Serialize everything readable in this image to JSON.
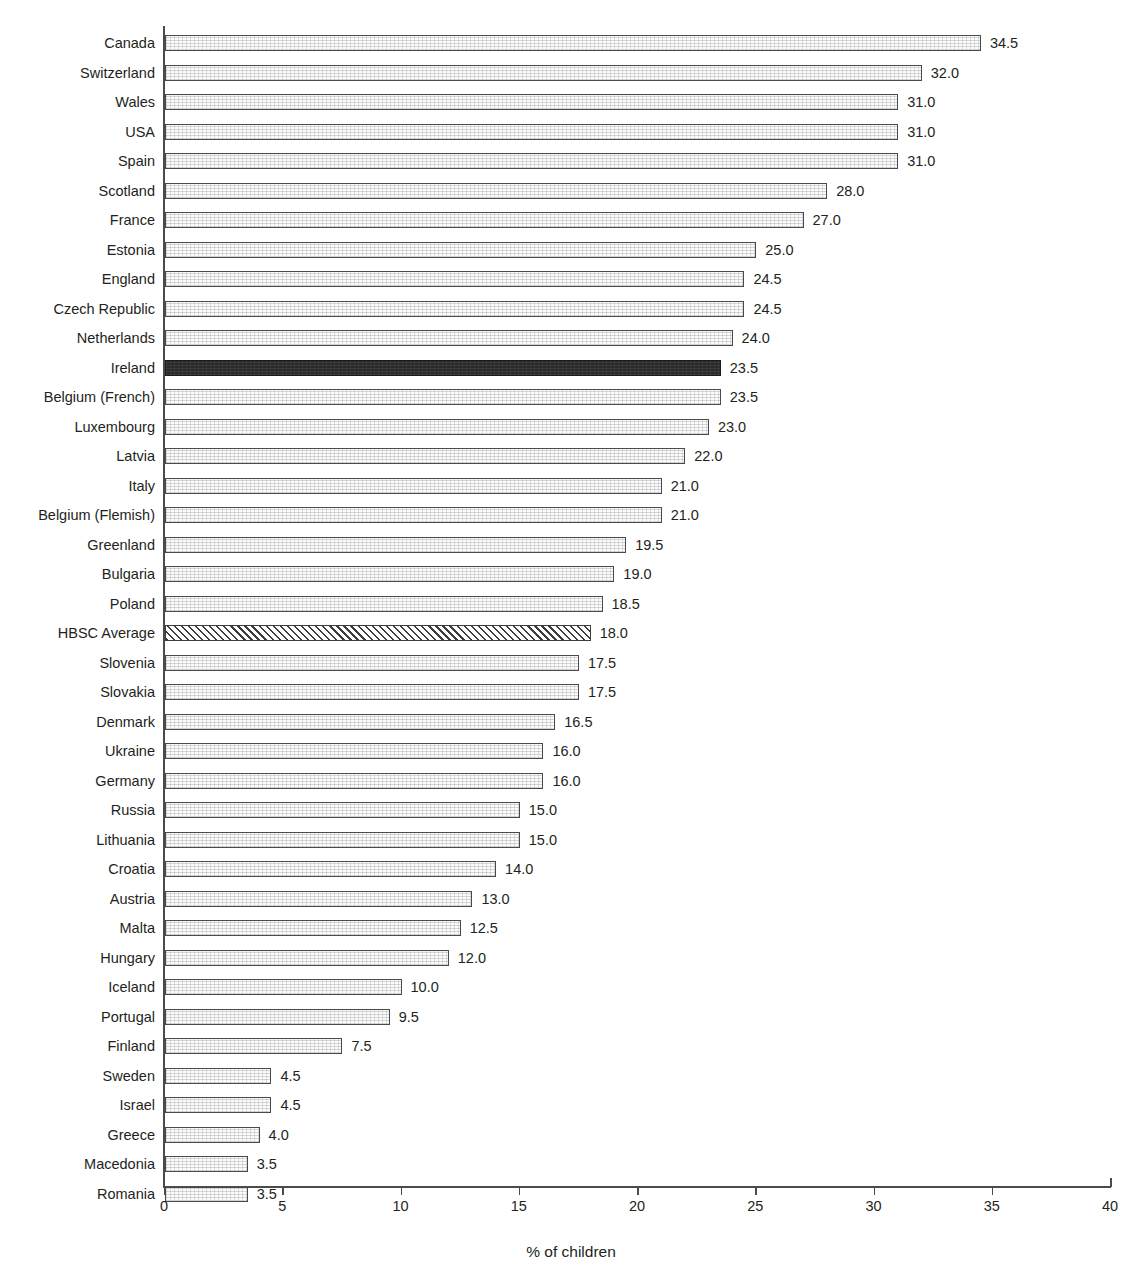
{
  "chart_data": {
    "type": "bar",
    "orientation": "horizontal",
    "title": "",
    "xlabel": "% of children",
    "ylabel": "",
    "xlim": [
      0,
      40
    ],
    "xticks": [
      0,
      5,
      10,
      15,
      20,
      25,
      30,
      35,
      40
    ],
    "xtick_labels": [
      "0",
      "5",
      "10",
      "15",
      "20",
      "25",
      "30",
      "35",
      "40"
    ],
    "grid": false,
    "legend": "none",
    "value_label_format": "one-decimal",
    "highlight_colors": {
      "ireland_fill": "#2a2a2a",
      "average_fill": "#ffffff",
      "default_fill": "#fbfbfb",
      "bar_border": "#4a4a4a",
      "axis": "#4b4b4b",
      "text": "#231f20"
    },
    "categories": [
      "Canada",
      "Switzerland",
      "Wales",
      "USA",
      "Spain",
      "Scotland",
      "France",
      "Estonia",
      "England",
      "Czech Republic",
      "Netherlands",
      "Ireland",
      "Belgium (French)",
      "Luxembourg",
      "Latvia",
      "Italy",
      "Belgium (Flemish)",
      "Greenland",
      "Bulgaria",
      "Poland",
      "HBSC Average",
      "Slovenia",
      "Slovakia",
      "Denmark",
      "Ukraine",
      "Germany",
      "Russia",
      "Lithuania",
      "Croatia",
      "Austria",
      "Malta",
      "Hungary",
      "Iceland",
      "Portugal",
      "Finland",
      "Sweden",
      "Israel",
      "Greece",
      "Macedonia",
      "Romania"
    ],
    "values": [
      34.5,
      32.0,
      31.0,
      31.0,
      31.0,
      28.0,
      27.0,
      25.0,
      24.5,
      24.5,
      24.0,
      23.5,
      23.5,
      23.0,
      22.0,
      21.0,
      21.0,
      19.5,
      19.0,
      18.5,
      18.0,
      17.5,
      17.5,
      16.5,
      16.0,
      16.0,
      15.0,
      15.0,
      14.0,
      13.0,
      12.5,
      12.0,
      10.0,
      9.5,
      7.5,
      4.5,
      4.5,
      4.0,
      3.5,
      3.5
    ],
    "value_labels": [
      "34.5",
      "32.0",
      "31.0",
      "31.0",
      "31.0",
      "28.0",
      "27.0",
      "25.0",
      "24.5",
      "24.5",
      "24.0",
      "23.5",
      "23.5",
      "23.0",
      "22.0",
      "21.0",
      "21.0",
      "19.5",
      "19.0",
      "18.5",
      "18.0",
      "17.5",
      "17.5",
      "16.5",
      "16.0",
      "16.0",
      "15.0",
      "15.0",
      "14.0",
      "13.0",
      "12.5",
      "12.0",
      "10.0",
      "9.5",
      "7.5",
      "4.5",
      "4.5",
      "4.0",
      "3.5",
      "3.5"
    ],
    "bar_styles": [
      "plain",
      "plain",
      "plain",
      "plain",
      "plain",
      "plain",
      "plain",
      "plain",
      "plain",
      "plain",
      "plain",
      "highlight",
      "plain",
      "plain",
      "plain",
      "plain",
      "plain",
      "plain",
      "plain",
      "plain",
      "hatched",
      "plain",
      "plain",
      "plain",
      "plain",
      "plain",
      "plain",
      "plain",
      "plain",
      "plain",
      "plain",
      "plain",
      "plain",
      "plain",
      "plain",
      "plain",
      "plain",
      "plain",
      "plain",
      "plain"
    ]
  }
}
